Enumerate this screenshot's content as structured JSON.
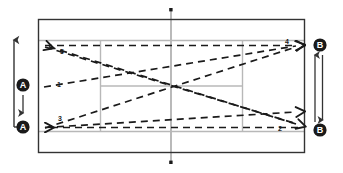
{
  "diagram": {
    "type": "tennis-court-drill",
    "colors": {
      "court_line": "#333333",
      "inner_line": "#b3b3b3",
      "shot_path": "#1a1a1a",
      "marker_fill": "#1a1a1a",
      "marker_text": "#ffffff",
      "background": "#ffffff"
    },
    "court": {
      "outer_boundary_label": "court-outline",
      "net_label": "net-line",
      "service_line_left_label": "service-line-left",
      "service_line_right_label": "service-line-right",
      "center_service_line_label": "center-service-line",
      "doubles_line_top_label": "doubles-sideline-top",
      "doubles_line_bottom_label": "doubles-sideline-bottom"
    },
    "shots": [
      {
        "id": "1",
        "label": "1",
        "label_x": 57,
        "label_y": 85,
        "direction": "right-up",
        "from": [
          44,
          88
        ],
        "to": [
          296,
          46
        ]
      },
      {
        "id": "2",
        "label": "2",
        "label_x": 280,
        "label_y": 131,
        "direction": "right",
        "from": [
          44,
          127
        ],
        "to": [
          300,
          127
        ]
      },
      {
        "id": "3",
        "label": "3",
        "label_x": 58,
        "label_y": 120,
        "direction": "left-up",
        "from": [
          296,
          124
        ],
        "to": [
          44,
          127
        ]
      },
      {
        "id": "4",
        "label": "4",
        "label_x": 287,
        "label_y": 42,
        "direction": "right",
        "from": [
          44,
          45
        ],
        "to": [
          300,
          45
        ]
      },
      {
        "id": "5",
        "label": "5",
        "label_x": 61,
        "label_y": 52,
        "direction": "left-down",
        "from": [
          296,
          124
        ],
        "to": [
          44,
          45
        ]
      }
    ],
    "markers": {
      "left": [
        {
          "id": "A-top",
          "label": "A",
          "cx": 23,
          "cy": 85
        },
        {
          "id": "A-bottom",
          "label": "A",
          "cx": 23,
          "cy": 127
        }
      ],
      "right": [
        {
          "id": "B-top",
          "label": "B",
          "cx": 321,
          "cy": 45
        },
        {
          "id": "B-bottom",
          "label": "B",
          "cx": 321,
          "cy": 130
        }
      ]
    },
    "movement_arrows": [
      {
        "id": "left-movement-arrow",
        "orientation": "vertical",
        "double_headed": true,
        "x": 14,
        "y_top": 38,
        "y_bottom": 127
      },
      {
        "id": "right-movement-arrow",
        "orientation": "vertical",
        "double_headed": true,
        "x": 318,
        "y_top": 54,
        "y_bottom": 121
      }
    ]
  }
}
